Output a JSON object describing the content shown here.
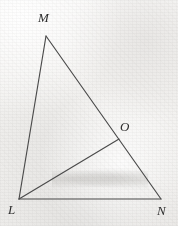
{
  "figure": {
    "kind": "geometry-diagram",
    "canvas": {
      "width": 178,
      "height": 226
    },
    "background_color": "#f3f2f0",
    "stroke_color": "#4a4a4a",
    "label_color": "#2e2e2e",
    "points": [
      {
        "id": "M",
        "label": "M",
        "x": 46,
        "y": 36,
        "label_x": 38,
        "label_y": 11,
        "on_segment": null
      },
      {
        "id": "O",
        "label": "O",
        "x": 119,
        "y": 139,
        "label_x": 120,
        "label_y": 120,
        "on_segment": "MN"
      },
      {
        "id": "L",
        "label": "L",
        "x": 19,
        "y": 199,
        "label_x": 8,
        "label_y": 203,
        "on_segment": null
      },
      {
        "id": "N",
        "label": "N",
        "x": 161,
        "y": 199,
        "label_x": 157,
        "label_y": 204,
        "on_segment": null
      }
    ],
    "segments": [
      {
        "id": "LM",
        "from": "L",
        "to": "M",
        "name": "side-lm"
      },
      {
        "id": "MN",
        "from": "M",
        "to": "N",
        "name": "side-mn"
      },
      {
        "id": "LN",
        "from": "L",
        "to": "N",
        "name": "side-ln"
      },
      {
        "id": "LO",
        "from": "L",
        "to": "O",
        "name": "cevian-lo"
      }
    ]
  }
}
